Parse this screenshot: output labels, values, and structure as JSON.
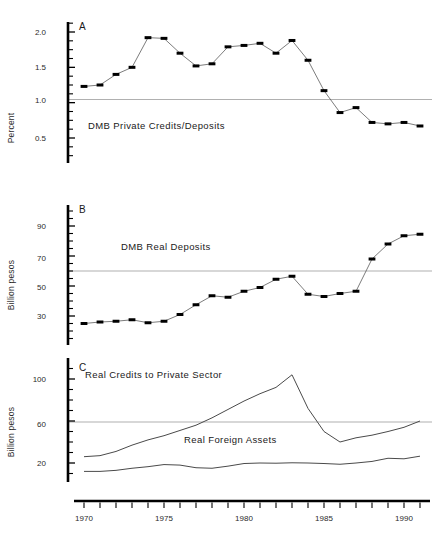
{
  "figure": {
    "title": "",
    "background": "#ffffff",
    "panels": [
      "A",
      "B",
      "C"
    ]
  },
  "axis_style": {
    "line_color": "#000000",
    "grid_color": "#8e8e8e",
    "series_color": "#5a5a5a",
    "marker_color": "#000000"
  },
  "xaxis": {
    "label": "",
    "tick_labels": [
      "1970",
      "1975",
      "1980",
      "1985",
      "1990"
    ],
    "tick_values": [
      1970,
      1975,
      1980,
      1985,
      1990
    ],
    "range": [
      1969.5,
      1991.5
    ],
    "minor_tick_step": 1
  },
  "chart_data": [
    {
      "type": "line",
      "panel": "A",
      "title": "A",
      "series_label": "DMB Private Credits/Deposits",
      "xlabel": "",
      "ylabel": "Percent",
      "ylim": [
        0.35,
        2.15
      ],
      "yticks": [
        0.5,
        1.0,
        1.5,
        2.0
      ],
      "ytick_labels": [
        "0.5",
        "1.0",
        "1.5",
        "2.0"
      ],
      "gridlines": [
        1.0
      ],
      "markers": true,
      "grid": true,
      "legend": "inside-annotation",
      "x": [
        1970,
        1971,
        1972,
        1973,
        1974,
        1975,
        1976,
        1977,
        1978,
        1979,
        1980,
        1981,
        1982,
        1983,
        1984,
        1985,
        1986,
        1987,
        1988,
        1989,
        1990,
        1991
      ],
      "values": [
        1.23,
        1.25,
        1.4,
        1.5,
        1.92,
        1.91,
        1.7,
        1.52,
        1.55,
        1.79,
        1.81,
        1.84,
        1.7,
        1.88,
        1.6,
        1.17,
        0.86,
        0.93,
        0.72,
        0.7,
        0.72,
        0.67
      ]
    },
    {
      "type": "line",
      "panel": "B",
      "title": "B",
      "series_label": "DMB Real Deposits",
      "xlabel": "",
      "ylabel": "Billion pesos",
      "ylim": [
        18,
        102
      ],
      "yticks": [
        30,
        50,
        70,
        90
      ],
      "ytick_labels": [
        "30",
        "50",
        "70",
        "90"
      ],
      "gridlines": [
        60
      ],
      "markers": true,
      "grid": true,
      "legend": "inside-annotation",
      "x": [
        1970,
        1971,
        1972,
        1973,
        1974,
        1975,
        1976,
        1977,
        1978,
        1979,
        1980,
        1981,
        1982,
        1983,
        1984,
        1985,
        1986,
        1987,
        1988,
        1989,
        1990,
        1991
      ],
      "values": [
        25.0,
        26.0,
        26.5,
        27.5,
        25.5,
        26.5,
        31.0,
        37.5,
        43.5,
        42.5,
        46.5,
        49.0,
        54.5,
        56.5,
        44.5,
        43.0,
        45.0,
        46.5,
        68.0,
        78.0,
        83.5,
        84.5
      ]
    },
    {
      "type": "line",
      "panel": "C",
      "title": "C",
      "xlabel": "",
      "ylabel": "Billion pesos",
      "ylim": [
        5,
        112
      ],
      "yticks": [
        20,
        60,
        100
      ],
      "ytick_labels": [
        "20",
        "60",
        "100"
      ],
      "gridlines": [
        62
      ],
      "markers": false,
      "grid": true,
      "legend": "inside-annotation",
      "x": [
        1970,
        1971,
        1972,
        1973,
        1974,
        1975,
        1976,
        1977,
        1978,
        1979,
        1980,
        1981,
        1982,
        1983,
        1984,
        1985,
        1986,
        1987,
        1988,
        1989,
        1990,
        1991
      ],
      "series": [
        {
          "name": "Real Credits to Private Sector",
          "values": [
            26.0,
            27.0,
            31.0,
            37.0,
            42.0,
            46.0,
            51.0,
            56.0,
            63.0,
            71.0,
            79.0,
            86.0,
            92.0,
            104.0,
            72.0,
            50.0,
            40.0,
            44.0,
            46.5,
            50.0,
            54.0,
            60.0
          ]
        },
        {
          "name": "Real Foreign Assets",
          "values": [
            12.0,
            12.0,
            13.0,
            15.0,
            16.5,
            18.5,
            18.0,
            15.5,
            15.0,
            17.0,
            19.5,
            20.0,
            19.8,
            20.2,
            20.0,
            19.5,
            18.8,
            20.0,
            21.5,
            24.5,
            24.0,
            26.5
          ]
        }
      ]
    }
  ],
  "annotations": {
    "panel_a_letter": "A",
    "panel_b_letter": "B",
    "panel_c_letter": "C",
    "label_a_series": "DMB Private Credits/Deposits",
    "label_b_series": "DMB Real Deposits",
    "label_c_series_1": "Real Credits to Private Sector",
    "label_c_series_2": "Real Foreign Assets",
    "ylabel_percent": "Percent",
    "ylabel_billion_pesos_b": "Billion pesos",
    "ylabel_billion_pesos_c": "Billion pesos"
  }
}
